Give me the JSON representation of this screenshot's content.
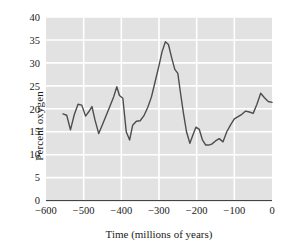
{
  "chart_data": {
    "type": "line",
    "title": "",
    "xlabel": "Time (millions of years)",
    "ylabel": "Percent oxygen",
    "xlim": [
      -600,
      0
    ],
    "ylim": [
      0,
      40
    ],
    "xticks": [
      "−600",
      "−500",
      "−400",
      "−300",
      "−200",
      "−100",
      "0"
    ],
    "xtick_values": [
      -600,
      -500,
      -400,
      -300,
      -200,
      -100,
      0
    ],
    "yticks": [
      "0",
      "5",
      "10",
      "15",
      "20",
      "25",
      "30",
      "35",
      "40"
    ],
    "ytick_values": [
      0,
      5,
      10,
      15,
      20,
      25,
      30,
      35,
      40
    ],
    "grid": true,
    "grid_color": "#ffffff",
    "plot_background": "#e2e2e2",
    "line_color": "#4d4d4d",
    "legend": "none",
    "x": [
      -555,
      -545,
      -535,
      -525,
      -515,
      -505,
      -495,
      -487,
      -478,
      -470,
      -460,
      -450,
      -440,
      -430,
      -420,
      -412,
      -405,
      -396,
      -387,
      -378,
      -370,
      -360,
      -350,
      -340,
      -330,
      -320,
      -310,
      -300,
      -292,
      -283,
      -275,
      -266,
      -258,
      -250,
      -243,
      -235,
      -227,
      -218,
      -210,
      -202,
      -193,
      -185,
      -176,
      -168,
      -160,
      -150,
      -140,
      -130,
      -120,
      -110,
      -100,
      -90,
      -80,
      -70,
      -60,
      -50,
      -40,
      -30,
      -20,
      -10,
      0
    ],
    "y": [
      18.9,
      18.6,
      15.4,
      18.7,
      21.0,
      20.8,
      18.4,
      19.3,
      20.5,
      17.6,
      14.6,
      16.6,
      18.6,
      20.6,
      22.7,
      24.8,
      22.9,
      22.3,
      15.0,
      13.2,
      16.4,
      17.3,
      17.4,
      18.5,
      20.3,
      22.6,
      26.0,
      29.4,
      32.4,
      34.6,
      34.0,
      31.0,
      28.6,
      27.7,
      23.5,
      19.0,
      15.0,
      12.5,
      14.3,
      16.0,
      15.5,
      13.3,
      12.1,
      12.1,
      12.3,
      13.0,
      13.5,
      12.8,
      15.0,
      16.5,
      17.8,
      18.3,
      18.8,
      19.5,
      19.3,
      19.0,
      21.0,
      23.4,
      22.4,
      21.6,
      21.4
    ]
  }
}
